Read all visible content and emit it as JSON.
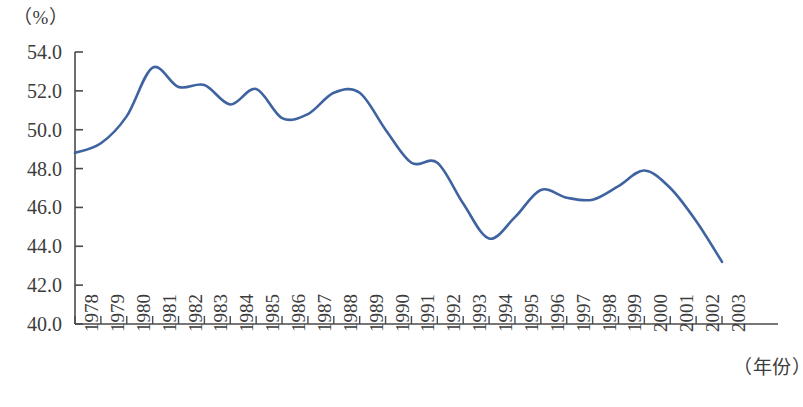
{
  "chart_data": {
    "type": "line",
    "title": "",
    "xlabel": "（年份）",
    "ylabel": "（%）",
    "ylim": [
      40.0,
      54.0
    ],
    "ytick_step": 2.0,
    "ytick_labels": [
      "54.0",
      "52.0",
      "50.0",
      "48.0",
      "46.0",
      "44.0",
      "42.0",
      "40.0"
    ],
    "ytick_values": [
      54.0,
      52.0,
      50.0,
      48.0,
      46.0,
      44.0,
      42.0,
      40.0
    ],
    "grid": false,
    "legend": false,
    "legend_position": "none",
    "line_color": "#3F63A0",
    "axis_color": "#4a4a4a",
    "categories": [
      "1978",
      "1979",
      "1980",
      "1981",
      "1982",
      "1983",
      "1984",
      "1985",
      "1986",
      "1987",
      "1988",
      "1989",
      "1990",
      "1991",
      "1992",
      "1993",
      "1994",
      "1995",
      "1996",
      "1997",
      "1998",
      "1999",
      "2000",
      "2001",
      "2002",
      "2003"
    ],
    "x": [
      1978,
      1979,
      1980,
      1981,
      1982,
      1983,
      1984,
      1985,
      1986,
      1987,
      1988,
      1989,
      1990,
      1991,
      1992,
      1993,
      1994,
      1995,
      1996,
      1997,
      1998,
      1999,
      2000,
      2001,
      2002,
      2003
    ],
    "values": [
      48.8,
      49.3,
      50.7,
      53.2,
      52.2,
      52.3,
      51.3,
      52.1,
      50.6,
      50.8,
      51.9,
      51.9,
      50.0,
      48.3,
      48.3,
      46.2,
      44.4,
      45.5,
      46.9,
      46.5,
      46.4,
      47.1,
      47.9,
      47.0,
      45.3,
      43.2
    ],
    "series": [
      {
        "name": "",
        "values": [
          48.8,
          49.3,
          50.7,
          53.2,
          52.2,
          52.3,
          51.3,
          52.1,
          50.6,
          50.8,
          51.9,
          51.9,
          50.0,
          48.3,
          48.3,
          46.2,
          44.4,
          45.5,
          46.9,
          46.5,
          46.4,
          47.1,
          47.9,
          47.0,
          45.3,
          43.2
        ]
      }
    ],
    "annotations": []
  }
}
